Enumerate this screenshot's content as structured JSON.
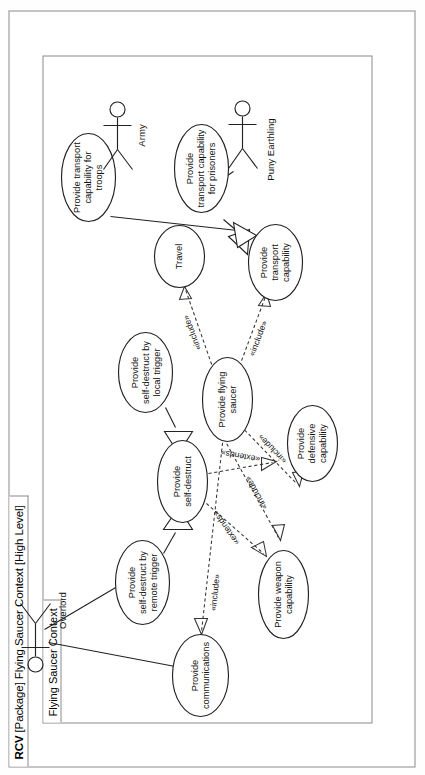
{
  "diagram": {
    "type": "uml-use-case",
    "outer_frame": {
      "kind_label": "RCV",
      "name_label": "[Package] Flying Saucer Context [High Level]",
      "full_label": "RCV [Package] Flying Saucer Context [High Level]"
    },
    "inner_frame": {
      "name_label": "Flying Saucer Context"
    },
    "actors": [
      {
        "id": "overlord",
        "label": "Overlord"
      },
      {
        "id": "puny-earthling",
        "label": "Puny Earthling"
      },
      {
        "id": "army",
        "label": "Army"
      }
    ],
    "use_cases": [
      {
        "id": "uc-self-destruct-remote",
        "lines": [
          "Provide",
          "self-destruct by",
          "remote trigger"
        ]
      },
      {
        "id": "uc-self-destruct-local",
        "lines": [
          "Provide",
          "self-destruct by",
          "local trigger"
        ]
      },
      {
        "id": "uc-self-destruct",
        "lines": [
          "Provide",
          "self-destruct"
        ]
      },
      {
        "id": "uc-weapon-capability",
        "lines": [
          "Provide weapon",
          "capability"
        ]
      },
      {
        "id": "uc-defensive-capability",
        "lines": [
          "Provide",
          "defensive",
          "capability"
        ]
      },
      {
        "id": "uc-communications",
        "lines": [
          "Provide",
          "communications"
        ]
      },
      {
        "id": "uc-flying-saucer",
        "lines": [
          "Provide flying",
          "saucer"
        ]
      },
      {
        "id": "uc-travel",
        "lines": [
          "Travel"
        ]
      },
      {
        "id": "uc-transport-capability",
        "lines": [
          "Provide",
          "transport",
          "capability"
        ]
      },
      {
        "id": "uc-transport-prisoners",
        "lines": [
          "Provide",
          "transport capability",
          "for prisoners"
        ]
      },
      {
        "id": "uc-transport-troops",
        "lines": [
          "Provide  transport",
          "capability for",
          "troops"
        ]
      }
    ],
    "stereotypes": {
      "include": "«include»",
      "extends": "«extends»"
    },
    "relationships": [
      {
        "from": "overlord",
        "to": "uc-self-destruct-remote",
        "kind": "association"
      },
      {
        "from": "overlord",
        "to": "uc-communications",
        "kind": "association"
      },
      {
        "from": "puny-earthling",
        "to": "uc-transport-prisoners",
        "kind": "association"
      },
      {
        "from": "army",
        "to": "uc-transport-troops",
        "kind": "association"
      },
      {
        "from": "uc-self-destruct-remote",
        "to": "uc-self-destruct",
        "kind": "generalization"
      },
      {
        "from": "uc-self-destruct-local",
        "to": "uc-self-destruct",
        "kind": "generalization"
      },
      {
        "from": "uc-self-destruct",
        "to": "uc-weapon-capability",
        "kind": "extends",
        "label": "«extends»"
      },
      {
        "from": "uc-self-destruct",
        "to": "uc-defensive-capability",
        "kind": "extends",
        "label": "«extends»"
      },
      {
        "from": "uc-flying-saucer",
        "to": "uc-communications",
        "kind": "include",
        "label": "«include»"
      },
      {
        "from": "uc-flying-saucer",
        "to": "uc-weapon-capability",
        "kind": "include",
        "label": "«include»"
      },
      {
        "from": "uc-flying-saucer",
        "to": "uc-defensive-capability",
        "kind": "include",
        "label": "«include»"
      },
      {
        "from": "uc-flying-saucer",
        "to": "uc-travel",
        "kind": "include",
        "label": "«include»"
      },
      {
        "from": "uc-flying-saucer",
        "to": "uc-transport-capability",
        "kind": "include",
        "label": "«include»"
      },
      {
        "from": "uc-transport-prisoners",
        "to": "uc-transport-capability",
        "kind": "generalization"
      },
      {
        "from": "uc-transport-troops",
        "to": "uc-transport-capability",
        "kind": "generalization"
      }
    ],
    "stereotype_labels": [
      {
        "id": "extends-1",
        "text": "«extends»"
      },
      {
        "id": "extends-2",
        "text": "«extends»"
      },
      {
        "id": "include-1",
        "text": "«include»"
      },
      {
        "id": "include-2",
        "text": "«include»"
      },
      {
        "id": "include-3",
        "text": "«include»"
      },
      {
        "id": "include-4",
        "text": "«include»"
      },
      {
        "id": "include-5",
        "text": "«include»"
      }
    ],
    "colors": {
      "frame_stroke": "#8a8a8a",
      "shape_stroke": "#222222",
      "shape_fill": "#ffffff",
      "text": "#111111",
      "background": "#ffffff"
    }
  }
}
